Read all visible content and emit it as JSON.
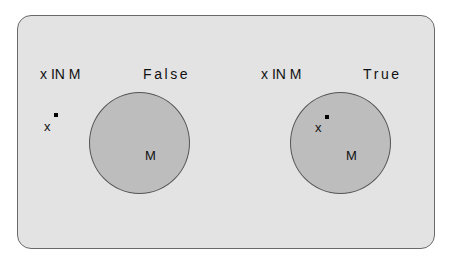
{
  "diagram": {
    "panels": [
      {
        "expression": "x IN M",
        "result": "False",
        "element_label": "x",
        "set_label": "M",
        "element_inside_set": false
      },
      {
        "expression": "x IN M",
        "result": "True",
        "element_label": "x",
        "set_label": "M",
        "element_inside_set": true
      }
    ],
    "colors": {
      "panel_background": "#e3e3e3",
      "panel_border": "#6a6a6a",
      "set_fill": "#bdbdbd",
      "set_border": "#555555",
      "text": "#111111"
    }
  }
}
